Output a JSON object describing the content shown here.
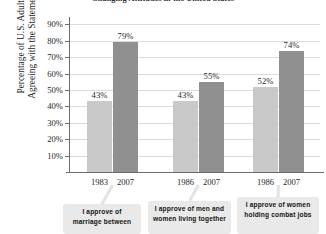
{
  "chart_data": {
    "type": "bar",
    "title": "Changing Attitudes in the United States",
    "xlabel": "",
    "ylabel": "Percentage of U.S. Adults Agreeing with the Statement",
    "ylabel_line1": "Percentage of U.S. Adults",
    "ylabel_line2": "Agreeing with the Statement",
    "ylim": [
      0,
      90
    ],
    "y_ticks": [
      "90%",
      "80%",
      "70%",
      "60%",
      "50%",
      "40%",
      "30%",
      "20%",
      "10%"
    ],
    "y_tick_values": [
      90,
      80,
      70,
      60,
      50,
      40,
      30,
      20,
      10
    ],
    "grid": true,
    "legend": "none",
    "categories": [
      "1983",
      "2007",
      "1986",
      "2007",
      "1986",
      "2007"
    ],
    "values": [
      43,
      79,
      43,
      55,
      52,
      74
    ],
    "value_labels": [
      "43%",
      "79%",
      "43%",
      "55%",
      "52%",
      "74%"
    ],
    "groups": [
      {
        "statement": "I approve of marriage between",
        "bars": [
          {
            "year": "1983",
            "value": 43,
            "label": "43%",
            "series": "earlier"
          },
          {
            "year": "2007",
            "value": 79,
            "label": "79%",
            "series": "2007"
          }
        ]
      },
      {
        "statement": "I approve of men and women living together",
        "bars": [
          {
            "year": "1986",
            "value": 43,
            "label": "43%",
            "series": "earlier"
          },
          {
            "year": "2007",
            "value": 55,
            "label": "55%",
            "series": "2007"
          }
        ]
      },
      {
        "statement": "I approve of women holding combat jobs",
        "bars": [
          {
            "year": "1986",
            "value": 52,
            "label": "52%",
            "series": "earlier"
          },
          {
            "year": "2007",
            "value": 74,
            "label": "74%",
            "series": "2007"
          }
        ]
      }
    ],
    "colors": {
      "bar_earlier": "#c9c9c9",
      "bar_2007": "#909090",
      "bar_border": "#a8a8a8",
      "gridline": "#dcdcdc",
      "axis": "#6d6d6d",
      "callout_bg": "#e9e9e9",
      "text": "#1f1f1f"
    }
  },
  "callouts": [
    {
      "line1": "I approve of",
      "line2": "marriage between"
    },
    {
      "line1": "I approve of men and",
      "line2": "women living together"
    },
    {
      "line1": "I approve of women",
      "line2": "holding combat jobs"
    }
  ]
}
